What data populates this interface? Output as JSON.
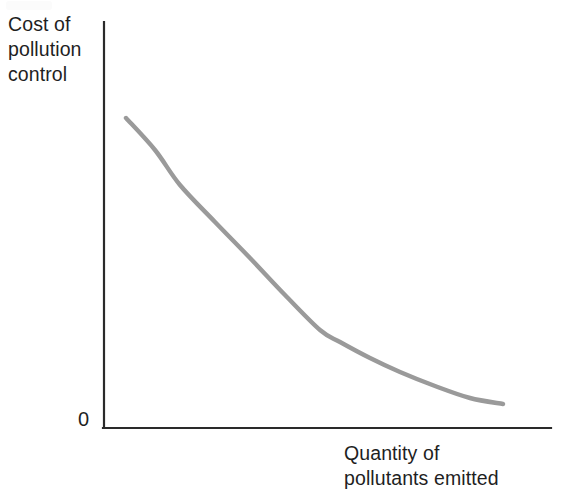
{
  "figure": {
    "width": 577,
    "height": 502,
    "background": "#ffffff"
  },
  "labels": {
    "y_axis": "Cost of\npollution\ncontrol",
    "x_axis": "Quantity of\npollutants emitted",
    "origin": "0"
  },
  "colors": {
    "axis": "#2a2a2a",
    "curve": "#9a9a9a",
    "background": "#ffffff",
    "text": "#1f1f1f"
  },
  "chart_data": {
    "type": "line",
    "title": "",
    "subtitle": "",
    "xlabel": "Quantity of pollutants emitted",
    "ylabel": "Cost of pollution control",
    "grid": false,
    "legend": null,
    "axis_origin_label": "0",
    "xlim": [
      0,
      1
    ],
    "ylim": [
      0,
      1
    ],
    "xticks": [],
    "yticks": [],
    "xticklabels": [],
    "yticklabels": [],
    "annotations": [],
    "series": [
      {
        "name": "Marginal cost of pollution control",
        "color": "#9a9a9a",
        "linewidth": 4,
        "shape": "convex-decreasing",
        "x": [
          0.05,
          0.12,
          0.2,
          0.28,
          0.36,
          0.44,
          0.53,
          0.62,
          0.7,
          0.78,
          0.86,
          0.93,
          1.0
        ],
        "y": [
          0.76,
          0.68,
          0.6,
          0.52,
          0.45,
          0.39,
          0.32,
          0.26,
          0.21,
          0.16,
          0.12,
          0.09,
          0.06
        ],
        "pixel_points": [
          [
            126,
            118
          ],
          [
            155,
            150
          ],
          [
            180,
            185
          ],
          [
            215,
            222
          ],
          [
            250,
            258
          ],
          [
            285,
            295
          ],
          [
            320,
            330
          ],
          [
            340,
            342
          ],
          [
            370,
            358
          ],
          [
            400,
            372
          ],
          [
            435,
            386
          ],
          [
            470,
            398
          ],
          [
            503,
            404
          ]
        ]
      }
    ]
  },
  "geometry": {
    "y_axis": {
      "x": 104,
      "y_top": 22,
      "y_bottom": 428
    },
    "x_axis": {
      "y": 428,
      "x_left": 104,
      "x_right": 551
    }
  }
}
